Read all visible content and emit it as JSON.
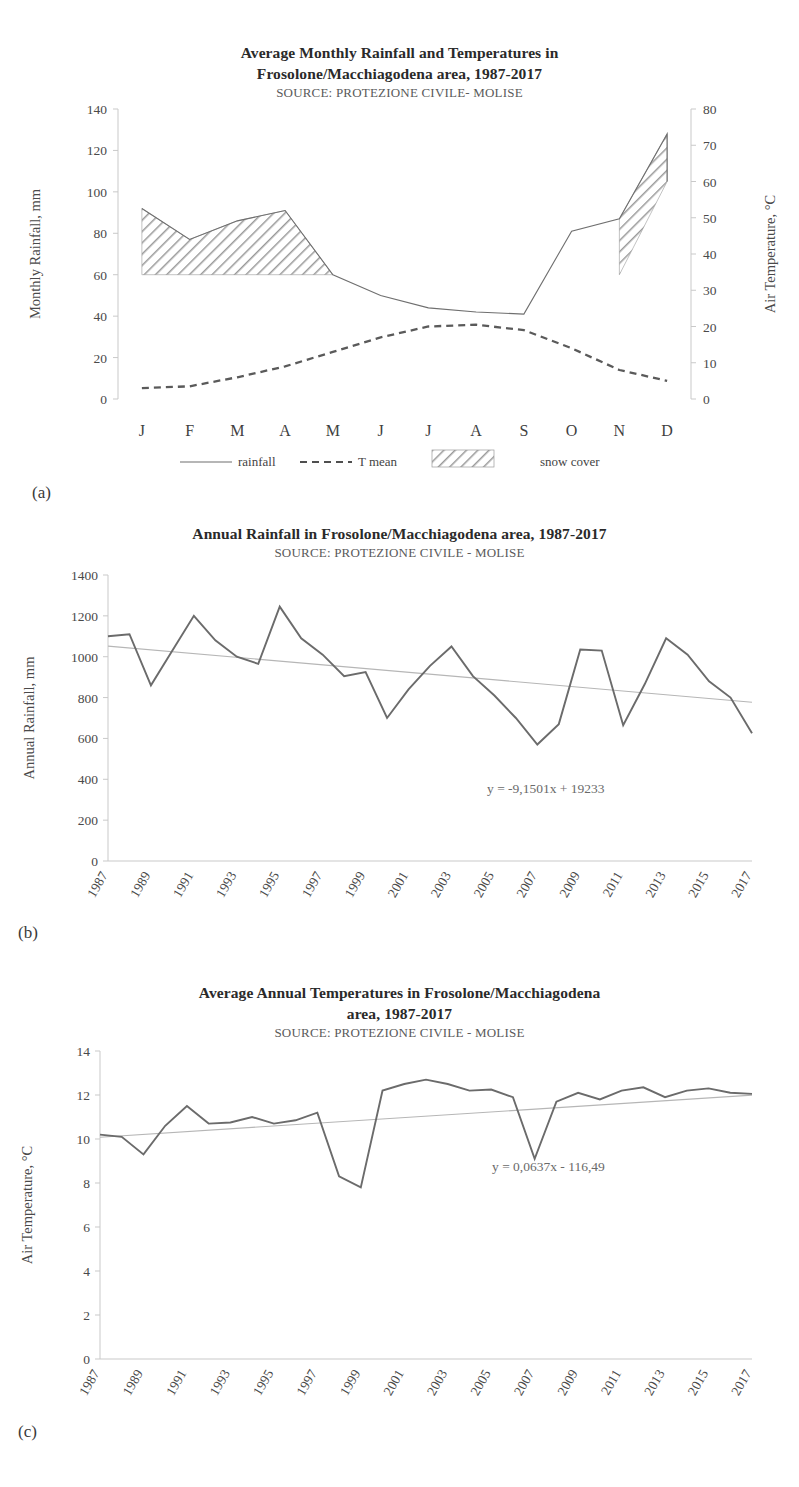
{
  "figure_a": {
    "title_line1": "Average Monthly Rainfall and Temperatures in",
    "title_line2": "Frosolone/Macchiagodena area, 1987-2017",
    "source": "SOURCE: PROTEZIONE CIVILE- MOLISE",
    "panel_label": "(a)",
    "legend": [
      {
        "name": "rainfall",
        "style": "solid-line"
      },
      {
        "name": "T mean",
        "style": "dashed-line"
      },
      {
        "name": "snow cover",
        "style": "hatch-swatch"
      }
    ]
  },
  "figure_b": {
    "title": "Annual Rainfall in Frosolone/Macchiagodena area, 1987-2017",
    "source": "SOURCE: PROTEZIONE CIVILE  - MOLISE",
    "panel_label": "(b)",
    "equation": "y = -9,1501x + 19233"
  },
  "figure_c": {
    "title_line1": "Average Annual Temperatures in Frosolone/Macchiagodena",
    "title_line2": "area, 1987-2017",
    "source": "SOURCE: PROTEZIONE CIVILE  - MOLISE",
    "panel_label": "(c)",
    "equation": "y = 0,0637x - 116,49"
  },
  "chart_data": [
    {
      "id": "monthly-rainfall-temperature",
      "type": "line",
      "title": "Average Monthly Rainfall and Temperatures in Frosolone/Macchiagodena area, 1987-2017",
      "subtitle": "SOURCE: PROTEZIONE CIVILE- MOLISE",
      "xlabel": "",
      "ylabel": "Monthly Rainfall, mm",
      "y2label": "Air Temperature, °C",
      "categories": [
        "J",
        "F",
        "M",
        "A",
        "M",
        "J",
        "J",
        "A",
        "S",
        "O",
        "N",
        "D"
      ],
      "ylim": [
        0,
        140
      ],
      "yticks": [
        0,
        20,
        40,
        60,
        80,
        100,
        120,
        140
      ],
      "y2lim": [
        0,
        80
      ],
      "y2ticks": [
        0,
        10,
        20,
        30,
        40,
        50,
        60,
        70,
        80
      ],
      "grid": false,
      "legend_position": "bottom",
      "series": [
        {
          "name": "rainfall",
          "axis": "left",
          "style": "solid",
          "values": [
            92,
            77,
            86,
            91,
            60,
            50,
            44,
            42,
            41,
            81,
            87,
            128
          ]
        },
        {
          "name": "T mean",
          "axis": "right",
          "style": "dashed",
          "values": [
            3,
            3.5,
            6,
            9,
            13,
            17,
            20,
            20.5,
            19,
            14,
            8,
            5
          ]
        },
        {
          "name": "snow cover",
          "axis": "left",
          "style": "hatched-area",
          "baseline": 60,
          "values": [
            92,
            77,
            86,
            91,
            null,
            null,
            null,
            null,
            null,
            null,
            87,
            128
          ],
          "note": "hatched band between 60 mm baseline and rainfall curve for J-A and N-D"
        }
      ]
    },
    {
      "id": "annual-rainfall",
      "type": "line",
      "title": "Annual Rainfall in Frosolone/Macchiagodena area, 1987-2017",
      "subtitle": "SOURCE: PROTEZIONE CIVILE  - MOLISE",
      "xlabel": "",
      "ylabel": "Annual Rainfall, mm",
      "ylim": [
        0,
        1400
      ],
      "yticks": [
        0,
        200,
        400,
        600,
        800,
        1000,
        1200,
        1400
      ],
      "grid": false,
      "x": [
        1987,
        1988,
        1989,
        1990,
        1991,
        1992,
        1993,
        1994,
        1995,
        1996,
        1997,
        1998,
        1999,
        2000,
        2001,
        2002,
        2003,
        2004,
        2005,
        2006,
        2007,
        2008,
        2009,
        2010,
        2011,
        2012,
        2013,
        2014,
        2015,
        2016,
        2017
      ],
      "xticklabels": [
        "1987",
        "1989",
        "1991",
        "1993",
        "1995",
        "1997",
        "1999",
        "2001",
        "2003",
        "2005",
        "2007",
        "2009",
        "2011",
        "2013",
        "2015",
        "2017"
      ],
      "values": [
        1100,
        1110,
        860,
        1030,
        1200,
        1080,
        1000,
        965,
        1245,
        1090,
        1010,
        905,
        925,
        700,
        840,
        955,
        1050,
        905,
        810,
        700,
        570,
        670,
        1035,
        1030,
        665,
        865,
        1090,
        1010,
        880,
        800,
        625
      ],
      "trendline": {
        "equation": "y = -9,1501x + 19233",
        "slope": -9.1501,
        "intercept": 19233
      },
      "annotations": [
        "y = -9,1501x + 19233"
      ]
    },
    {
      "id": "average-annual-temperature",
      "type": "line",
      "title": "Average Annual Temperatures in Frosolone/Macchiagodena area, 1987-2017",
      "subtitle": "SOURCE: PROTEZIONE CIVILE  - MOLISE",
      "xlabel": "",
      "ylabel": "Air Temperature, °C",
      "ylim": [
        0,
        14
      ],
      "yticks": [
        0,
        2,
        4,
        6,
        8,
        10,
        12,
        14
      ],
      "grid": false,
      "x": [
        1987,
        1988,
        1989,
        1990,
        1991,
        1992,
        1993,
        1994,
        1995,
        1996,
        1997,
        1998,
        1999,
        2000,
        2001,
        2002,
        2003,
        2004,
        2005,
        2006,
        2007,
        2008,
        2009,
        2010,
        2011,
        2012,
        2013,
        2014,
        2015,
        2016,
        2017
      ],
      "xticklabels": [
        "1987",
        "1989",
        "1991",
        "1993",
        "1995",
        "1997",
        "1999",
        "2001",
        "2003",
        "2005",
        "2007",
        "2009",
        "2011",
        "2013",
        "2015",
        "2017"
      ],
      "values": [
        10.2,
        10.1,
        9.3,
        10.6,
        11.5,
        10.7,
        10.75,
        11.0,
        10.7,
        10.85,
        11.2,
        8.3,
        7.8,
        12.2,
        12.5,
        12.7,
        12.5,
        12.2,
        12.25,
        11.9,
        9.1,
        11.7,
        12.1,
        11.8,
        12.2,
        12.35,
        11.9,
        12.2,
        12.3,
        12.1,
        12.05
      ],
      "trendline": {
        "equation": "y = 0,0637x - 116,49",
        "slope": 0.0637,
        "intercept": -116.49
      },
      "annotations": [
        "y = 0,0637x - 116,49"
      ]
    }
  ]
}
